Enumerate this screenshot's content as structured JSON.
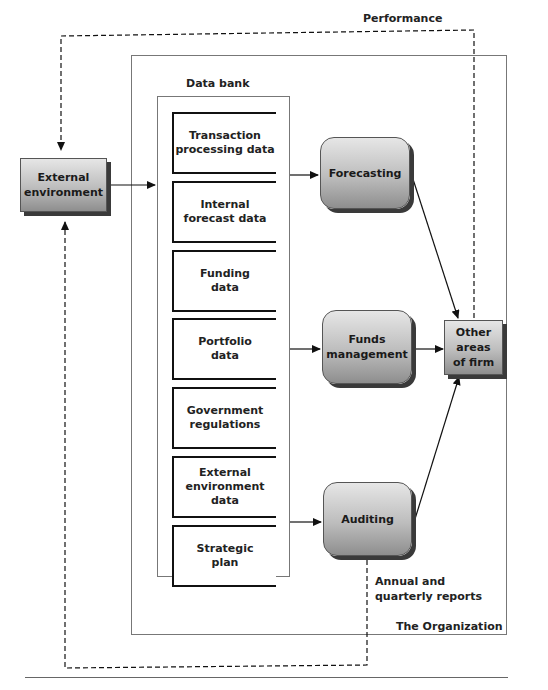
{
  "labels": {
    "performance": "Performance",
    "data_bank": "Data bank",
    "annual_reports_line1": "Annual and",
    "annual_reports_line2": "quarterly reports",
    "organization": "The Organization"
  },
  "external_environment": {
    "line1": "External",
    "line2": "environment"
  },
  "data_bank_items": [
    {
      "line1": "Transaction",
      "line2": "processing data",
      "line3": ""
    },
    {
      "line1": "Internal",
      "line2": "forecast data",
      "line3": ""
    },
    {
      "line1": "Funding",
      "line2": "data",
      "line3": ""
    },
    {
      "line1": "Portfolio",
      "line2": "data",
      "line3": ""
    },
    {
      "line1": "Government",
      "line2": "regulations",
      "line3": ""
    },
    {
      "line1": "External",
      "line2": "environment",
      "line3": "data"
    },
    {
      "line1": "Strategic",
      "line2": "plan",
      "line3": ""
    }
  ],
  "processes": {
    "forecasting": "Forecasting",
    "funds_management": {
      "line1": "Funds",
      "line2": "management"
    },
    "auditing": "Auditing"
  },
  "other_areas": {
    "line1": "Other",
    "line2": "areas",
    "line3": "of firm"
  },
  "colors": {
    "box_gradient_top": "#e6e6e6",
    "box_gradient_bottom": "#8e8e8e",
    "shadow": "#3a3a3a",
    "line": "#111111"
  }
}
